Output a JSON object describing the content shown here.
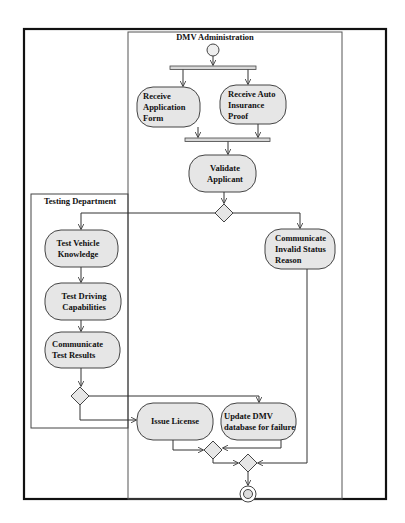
{
  "diagram": {
    "type": "UML activity diagram",
    "swimlanes": [
      {
        "id": "dmv",
        "title": "DMV Administration"
      },
      {
        "id": "testing",
        "title": "Testing Department"
      }
    ],
    "activities": {
      "receive_application": "Receive Application Form",
      "receive_insurance": "Receive Auto Insurance Proof",
      "validate_applicant": "Validate Applicant",
      "test_vehicle_knowledge": "Test Vehicle Knowledge",
      "communicate_invalid": "Communicate Invalid Status Reason",
      "test_driving": "Test Driving Capabilities",
      "communicate_results": "Communicate Test Results",
      "issue_license": "Issue License",
      "update_dmv_db": "Update DMV database for failure"
    },
    "nodes": {
      "start": "initial-node",
      "fork": "fork-bar",
      "join": "join-bar",
      "decision_valid": "decision",
      "decision_pass": "decision",
      "merge_1": "merge",
      "merge_2": "merge",
      "end": "final-node"
    },
    "colors": {
      "line": "#2a2a2a",
      "activity_fill": "#e6e6e6",
      "bar_fill": "#d8d8d8",
      "frame": "#111111",
      "background": "#ffffff"
    }
  }
}
